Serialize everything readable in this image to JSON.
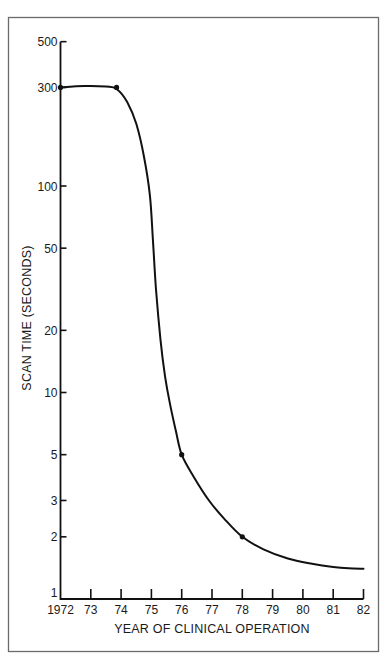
{
  "chart_data": {
    "type": "line",
    "title": "",
    "xlabel": "YEAR OF CLINICAL OPERATION",
    "ylabel": "SCAN TIME (SECONDS)",
    "yscale": "log",
    "xlim": [
      1972,
      1982
    ],
    "ylim": [
      1,
      500
    ],
    "grid": false,
    "legend": null,
    "x_ticks": [
      {
        "value": 1972,
        "label": "1972"
      },
      {
        "value": 1973,
        "label": "73"
      },
      {
        "value": 1974,
        "label": "74"
      },
      {
        "value": 1975,
        "label": "75"
      },
      {
        "value": 1976,
        "label": "76"
      },
      {
        "value": 1977,
        "label": "77"
      },
      {
        "value": 1978,
        "label": "78"
      },
      {
        "value": 1979,
        "label": "79"
      },
      {
        "value": 1980,
        "label": "80"
      },
      {
        "value": 1981,
        "label": "81"
      },
      {
        "value": 1982,
        "label": "82"
      }
    ],
    "y_ticks": [
      {
        "value": 1,
        "label": "1"
      },
      {
        "value": 2,
        "label": "2"
      },
      {
        "value": 3,
        "label": "3"
      },
      {
        "value": 5,
        "label": "5"
      },
      {
        "value": 10,
        "label": "10"
      },
      {
        "value": 20,
        "label": "20"
      },
      {
        "value": 50,
        "label": "50"
      },
      {
        "value": 100,
        "label": "100"
      },
      {
        "value": 300,
        "label": "300"
      },
      {
        "value": 500,
        "label": "500"
      }
    ],
    "markers": [
      {
        "x": 1972.0,
        "y": 300
      },
      {
        "x": 1973.85,
        "y": 300
      },
      {
        "x": 1976.0,
        "y": 5
      },
      {
        "x": 1978.0,
        "y": 2
      }
    ],
    "curve": {
      "x": [
        1972.0,
        1972.8,
        1973.5,
        1973.85,
        1974.2,
        1974.5,
        1974.75,
        1974.95,
        1975.05,
        1975.15,
        1975.3,
        1975.45,
        1975.6,
        1975.8,
        1976.0,
        1976.4,
        1976.9,
        1977.4,
        1978.0,
        1978.7,
        1979.5,
        1980.3,
        1981.0,
        1981.5,
        1982.0
      ],
      "y": [
        300,
        305,
        303,
        295,
        255,
        200,
        140,
        90,
        55,
        32,
        18,
        12,
        9,
        6.6,
        5.0,
        3.9,
        3.0,
        2.45,
        2.0,
        1.74,
        1.57,
        1.48,
        1.43,
        1.41,
        1.4
      ]
    }
  }
}
